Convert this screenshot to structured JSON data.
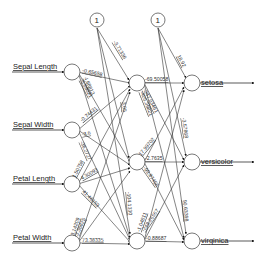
{
  "diagram": {
    "type": "neural-network",
    "inputs": [
      {
        "label": "Sepal Length"
      },
      {
        "label": "Sepal Width"
      },
      {
        "label": "Petal Length"
      },
      {
        "label": "Petal Width"
      }
    ],
    "outputs": [
      {
        "label": "setosa"
      },
      {
        "label": "versicolor"
      },
      {
        "label": "virginica"
      }
    ],
    "bias_label": "1",
    "weights": {
      "in_to_hidden": [
        [
          "-0.65658",
          "-5.68021",
          "4.68813",
          ""
        ],
        [
          "-0.74431",
          "-3.6",
          "-36.2727",
          ""
        ],
        [
          "1.50758",
          "4.30093",
          "41.46153",
          ""
        ],
        [
          "3.14209",
          "3.36825",
          "73.38335",
          ""
        ]
      ],
      "bias_to_hidden": [
        "-3.71336",
        "3.05",
        "-104.1330",
        ""
      ],
      "hidden_to_out": [
        [
          "-69.50058",
          "-247.03461",
          "-405.39821"
        ],
        [
          "17.99702",
          "-2.7635",
          "-99.87456"
        ],
        [
          "-1.04811",
          "-248.26567",
          "-0.88687"
        ]
      ],
      "bias_to_out": [
        "18.92",
        "-3.57868",
        "90.63398"
      ]
    }
  }
}
